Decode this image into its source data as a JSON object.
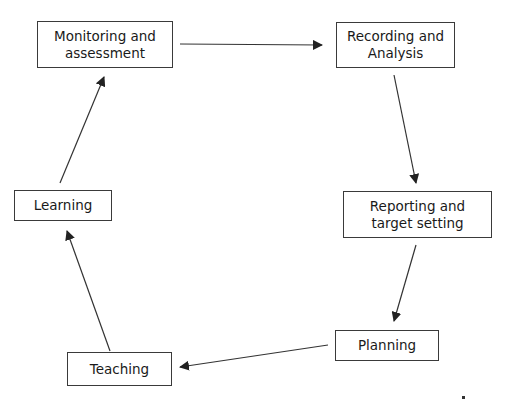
{
  "diagram": {
    "type": "cycle",
    "stroke_color": "#333333",
    "nodes": [
      {
        "id": "monitoring",
        "label": "Monitoring and\nassessment",
        "x": 37,
        "y": 21,
        "w": 136,
        "h": 47
      },
      {
        "id": "recording",
        "label": "Recording and\nAnalysis",
        "x": 336,
        "y": 22,
        "w": 119,
        "h": 46
      },
      {
        "id": "reporting",
        "label": "Reporting and\ntarget setting",
        "x": 343,
        "y": 191,
        "w": 149,
        "h": 47
      },
      {
        "id": "planning",
        "label": "Planning",
        "x": 335,
        "y": 330,
        "w": 104,
        "h": 31
      },
      {
        "id": "teaching",
        "label": "Teaching",
        "x": 67,
        "y": 352,
        "w": 105,
        "h": 34
      },
      {
        "id": "learning",
        "label": "Learning",
        "x": 14,
        "y": 190,
        "w": 98,
        "h": 31
      }
    ],
    "edges": [
      {
        "from": "monitoring",
        "to": "recording",
        "x1": 180,
        "y1": 44,
        "x2": 322,
        "y2": 45
      },
      {
        "from": "recording",
        "to": "reporting",
        "x1": 394,
        "y1": 75,
        "x2": 416,
        "y2": 183
      },
      {
        "from": "reporting",
        "to": "planning",
        "x1": 416,
        "y1": 245,
        "x2": 394,
        "y2": 321
      },
      {
        "from": "planning",
        "to": "teaching",
        "x1": 328,
        "y1": 345,
        "x2": 180,
        "y2": 367
      },
      {
        "from": "teaching",
        "to": "learning",
        "x1": 110,
        "y1": 351,
        "x2": 67,
        "y2": 231
      },
      {
        "from": "learning",
        "to": "monitoring",
        "x1": 60,
        "y1": 183,
        "x2": 104,
        "y2": 77
      }
    ]
  }
}
